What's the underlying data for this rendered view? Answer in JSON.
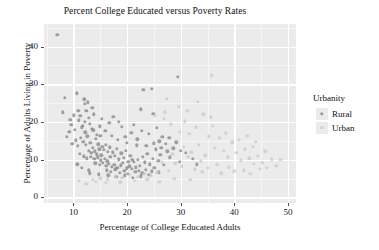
{
  "chart_data": {
    "type": "scatter",
    "title": "Percent College Educated versus Poverty Rates",
    "xlabel": "Percentage of College Educated Adults",
    "ylabel": "Percentage of Adults Living in Poverty",
    "xlim": [
      4.5,
      51.5
    ],
    "ylim": [
      -1.5,
      46
    ],
    "xticks": [
      10,
      20,
      30,
      40,
      50
    ],
    "yticks": [
      0,
      10,
      20,
      30,
      40
    ],
    "xtick_labels": [
      "10",
      "20",
      "30",
      "40",
      "50"
    ],
    "ytick_labels": [
      "0",
      "10",
      "20",
      "30",
      "40"
    ],
    "grid": true,
    "grid_major_color": "#ffffff",
    "grid_minor_color": "#f5f5f5",
    "panel_background": "#ebebeb",
    "legend": {
      "title": "Urbanity",
      "position": "right",
      "entries": [
        {
          "label": "Rural",
          "color": "#7f7f7f"
        },
        {
          "label": "Urban",
          "color": "#c8c8c8"
        }
      ]
    },
    "series": [
      {
        "name": "Rural",
        "color": "#7f7f7f",
        "points": [
          [
            7.0,
            43.2
          ],
          [
            8.4,
            26.4
          ],
          [
            8.0,
            22.6
          ],
          [
            10.6,
            27.6
          ],
          [
            10.9,
            23.0
          ],
          [
            11.3,
            21.6
          ],
          [
            11.0,
            20.4
          ],
          [
            12.1,
            24.8
          ],
          [
            12.4,
            22.9
          ],
          [
            12.8,
            21.1
          ],
          [
            9.6,
            19.2
          ],
          [
            10.2,
            18.0
          ],
          [
            11.6,
            18.6
          ],
          [
            12.2,
            17.3
          ],
          [
            13.0,
            19.5
          ],
          [
            13.4,
            18.2
          ],
          [
            13.8,
            22.0
          ],
          [
            12.6,
            16.2
          ],
          [
            11.4,
            15.8
          ],
          [
            10.4,
            15.1
          ],
          [
            9.8,
            14.2
          ],
          [
            10.8,
            13.6
          ],
          [
            11.8,
            14.8
          ],
          [
            12.3,
            13.9
          ],
          [
            13.1,
            14.5
          ],
          [
            13.6,
            13.2
          ],
          [
            14.2,
            15.6
          ],
          [
            14.6,
            14.1
          ],
          [
            15.0,
            16.4
          ],
          [
            15.4,
            13.4
          ],
          [
            12.9,
            12.4
          ],
          [
            13.3,
            11.8
          ],
          [
            14.0,
            12.2
          ],
          [
            14.4,
            11.4
          ],
          [
            14.8,
            12.8
          ],
          [
            15.2,
            11.2
          ],
          [
            15.6,
            12.6
          ],
          [
            16.0,
            14.0
          ],
          [
            16.4,
            12.1
          ],
          [
            16.8,
            13.3
          ],
          [
            11.2,
            11.6
          ],
          [
            11.9,
            10.9
          ],
          [
            12.5,
            10.4
          ],
          [
            13.2,
            10.8
          ],
          [
            13.9,
            10.2
          ],
          [
            14.5,
            10.6
          ],
          [
            15.1,
            9.8
          ],
          [
            15.8,
            10.3
          ],
          [
            16.3,
            9.6
          ],
          [
            16.9,
            10.7
          ],
          [
            17.3,
            12.0
          ],
          [
            17.7,
            11.0
          ],
          [
            18.1,
            12.9
          ],
          [
            18.5,
            10.1
          ],
          [
            18.9,
            11.7
          ],
          [
            19.4,
            10.5
          ],
          [
            19.8,
            12.3
          ],
          [
            20.2,
            9.4
          ],
          [
            20.6,
            11.1
          ],
          [
            21.0,
            10.0
          ],
          [
            14.1,
            9.0
          ],
          [
            14.9,
            8.6
          ],
          [
            15.5,
            9.2
          ],
          [
            16.1,
            8.3
          ],
          [
            16.6,
            8.9
          ],
          [
            17.1,
            8.1
          ],
          [
            17.6,
            8.7
          ],
          [
            18.2,
            7.9
          ],
          [
            18.8,
            8.5
          ],
          [
            19.2,
            9.1
          ],
          [
            19.9,
            7.7
          ],
          [
            20.4,
            8.2
          ],
          [
            21.2,
            9.5
          ],
          [
            21.6,
            8.0
          ],
          [
            22.0,
            9.9
          ],
          [
            22.4,
            8.4
          ],
          [
            22.9,
            10.8
          ],
          [
            23.3,
            9.3
          ],
          [
            23.8,
            11.5
          ],
          [
            24.2,
            8.8
          ],
          [
            24.8,
            10.2
          ],
          [
            25.3,
            12.7
          ],
          [
            25.8,
            9.7
          ],
          [
            26.2,
            11.3
          ],
          [
            26.8,
            8.6
          ],
          [
            16.2,
            7.2
          ],
          [
            17.0,
            6.8
          ],
          [
            17.8,
            7.4
          ],
          [
            18.6,
            6.5
          ],
          [
            19.5,
            7.0
          ],
          [
            20.1,
            6.2
          ],
          [
            20.9,
            7.6
          ],
          [
            21.5,
            6.7
          ],
          [
            22.2,
            7.1
          ],
          [
            22.8,
            6.4
          ],
          [
            23.5,
            7.3
          ],
          [
            24.0,
            6.0
          ],
          [
            24.6,
            6.9
          ],
          [
            25.1,
            7.8
          ],
          [
            25.9,
            6.6
          ],
          [
            12.0,
            26.0
          ],
          [
            12.7,
            25.2
          ],
          [
            13.5,
            23.8
          ],
          [
            9.2,
            17.4
          ],
          [
            8.8,
            16.0
          ],
          [
            23.0,
            28.6
          ],
          [
            24.6,
            28.8
          ],
          [
            29.4,
            32.0
          ],
          [
            22.5,
            23.4
          ],
          [
            24.9,
            22.2
          ],
          [
            21.3,
            19.3
          ],
          [
            22.7,
            17.6
          ],
          [
            24.1,
            16.8
          ],
          [
            25.5,
            18.4
          ],
          [
            26.6,
            16.1
          ],
          [
            27.2,
            14.2
          ],
          [
            27.9,
            15.8
          ],
          [
            28.6,
            13.0
          ],
          [
            29.2,
            14.6
          ],
          [
            30.0,
            12.4
          ],
          [
            15.3,
            20.8
          ],
          [
            16.7,
            19.8
          ],
          [
            17.4,
            21.4
          ],
          [
            18.4,
            20.0
          ],
          [
            19.0,
            18.8
          ],
          [
            20.8,
            17.2
          ],
          [
            21.9,
            15.4
          ],
          [
            13.7,
            17.8
          ],
          [
            14.3,
            16.6
          ],
          [
            12.1,
            20.1
          ],
          [
            11.7,
            19.0
          ],
          [
            10.1,
            21.8
          ],
          [
            9.4,
            20.6
          ],
          [
            26.0,
            14.9
          ],
          [
            27.5,
            12.2
          ],
          [
            16.5,
            5.8
          ],
          [
            18.0,
            5.4
          ],
          [
            19.6,
            5.9
          ],
          [
            21.1,
            5.2
          ],
          [
            22.6,
            5.6
          ],
          [
            14.7,
            6.1
          ],
          [
            13.0,
            6.4
          ],
          [
            11.5,
            7.8
          ],
          [
            10.7,
            8.8
          ],
          [
            12.8,
            7.2
          ],
          [
            28.0,
            10.6
          ],
          [
            29.8,
            9.4
          ],
          [
            31.0,
            11.8
          ],
          [
            32.2,
            10.2
          ],
          [
            33.0,
            8.8
          ],
          [
            23.6,
            13.6
          ],
          [
            25.0,
            14.3
          ],
          [
            26.4,
            13.1
          ],
          [
            20.0,
            14.4
          ],
          [
            18.3,
            15.2
          ],
          [
            17.2,
            16.3
          ],
          [
            15.9,
            17.6
          ],
          [
            14.9,
            18.9
          ],
          [
            19.7,
            16.0
          ],
          [
            21.8,
            13.8
          ]
        ]
      },
      {
        "name": "Urban",
        "color": "#c8c8c8",
        "points": [
          [
            27.0,
            22.6
          ],
          [
            29.8,
            17.4
          ],
          [
            31.6,
            16.8
          ],
          [
            33.4,
            14.0
          ],
          [
            34.6,
            11.2
          ],
          [
            35.8,
            32.4
          ],
          [
            36.4,
            13.2
          ],
          [
            37.2,
            15.8
          ],
          [
            38.0,
            12.4
          ],
          [
            38.8,
            10.6
          ],
          [
            39.6,
            14.6
          ],
          [
            40.4,
            11.8
          ],
          [
            41.2,
            9.8
          ],
          [
            42.0,
            12.8
          ],
          [
            42.8,
            10.4
          ],
          [
            43.6,
            8.9
          ],
          [
            44.4,
            11.0
          ],
          [
            45.2,
            9.2
          ],
          [
            46.0,
            7.8
          ],
          [
            47.0,
            10.1
          ],
          [
            30.6,
            13.4
          ],
          [
            32.0,
            12.0
          ],
          [
            33.8,
            9.6
          ],
          [
            35.2,
            16.2
          ],
          [
            36.8,
            8.6
          ],
          [
            28.4,
            11.4
          ],
          [
            29.0,
            9.0
          ],
          [
            30.2,
            8.2
          ],
          [
            31.4,
            10.8
          ],
          [
            32.6,
            7.4
          ],
          [
            34.0,
            6.8
          ],
          [
            35.0,
            7.9
          ],
          [
            37.6,
            6.4
          ],
          [
            39.0,
            8.0
          ],
          [
            40.0,
            6.9
          ],
          [
            41.8,
            7.2
          ],
          [
            43.0,
            6.2
          ],
          [
            44.8,
            7.6
          ],
          [
            26.5,
            9.4
          ],
          [
            27.8,
            7.0
          ],
          [
            25.6,
            6.6
          ],
          [
            24.4,
            5.8
          ],
          [
            23.2,
            6.2
          ],
          [
            22.0,
            5.4
          ],
          [
            20.5,
            6.0
          ],
          [
            19.1,
            5.2
          ],
          [
            17.9,
            5.6
          ],
          [
            16.4,
            4.8
          ],
          [
            15.0,
            5.1
          ],
          [
            13.6,
            4.6
          ],
          [
            30.8,
            20.2
          ],
          [
            32.8,
            18.6
          ],
          [
            28.2,
            19.4
          ],
          [
            26.8,
            20.8
          ],
          [
            25.2,
            21.6
          ],
          [
            34.2,
            22.0
          ],
          [
            36.0,
            19.0
          ],
          [
            38.4,
            17.0
          ],
          [
            40.8,
            15.2
          ],
          [
            43.4,
            13.4
          ],
          [
            21.4,
            4.4
          ],
          [
            23.8,
            4.8
          ],
          [
            26.0,
            4.2
          ],
          [
            28.8,
            5.0
          ],
          [
            31.8,
            4.6
          ],
          [
            18.7,
            4.0
          ],
          [
            16.0,
            3.8
          ],
          [
            14.2,
            4.2
          ],
          [
            12.4,
            3.6
          ],
          [
            11.0,
            4.4
          ],
          [
            45.8,
            12.2
          ],
          [
            47.8,
            8.4
          ],
          [
            48.6,
            10.0
          ],
          [
            44.0,
            14.8
          ],
          [
            42.4,
            16.4
          ],
          [
            29.6,
            24.0
          ],
          [
            31.2,
            23.0
          ],
          [
            33.2,
            25.4
          ],
          [
            27.4,
            26.2
          ],
          [
            35.6,
            21.2
          ]
        ]
      }
    ]
  }
}
